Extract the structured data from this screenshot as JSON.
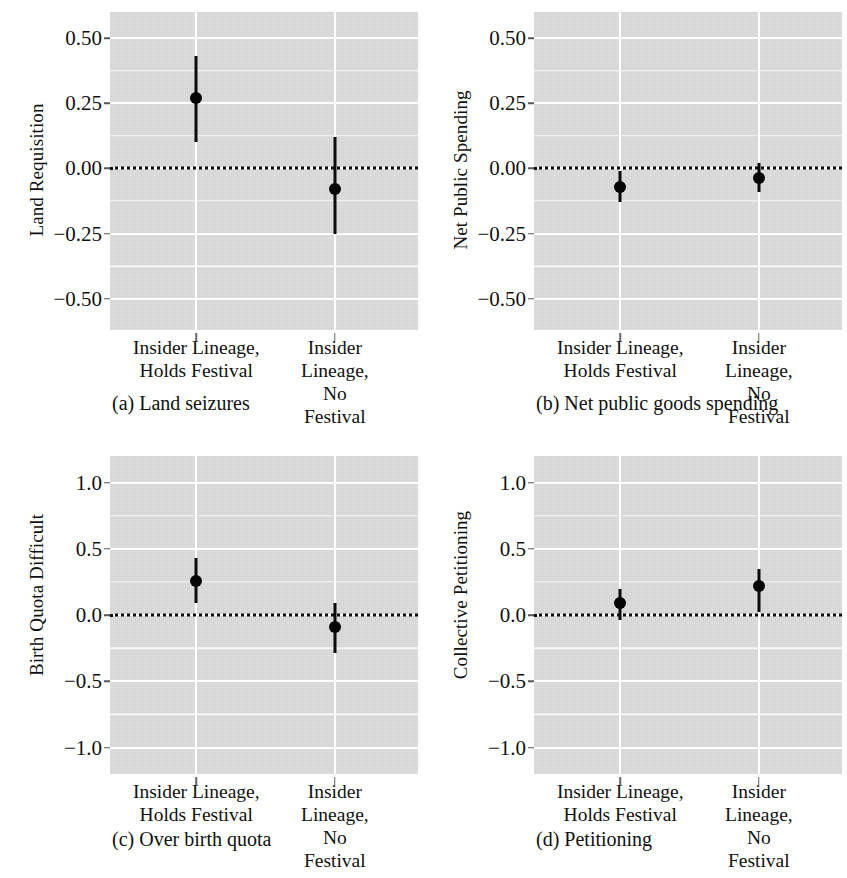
{
  "figure": {
    "panel_count": 4,
    "group_labels": [
      "Insider Lineage,\nHolds Festival",
      "Insider Lineage,\nNo Festival"
    ]
  },
  "panels": {
    "a": {
      "caption": "(a) Land seizures",
      "ylabel": "Land Requisition",
      "yticks": [
        "0.50",
        "0.25",
        "0.00",
        "-0.25",
        "-0.50"
      ],
      "xlabels": [
        "Insider Lineage,\nHolds Festival",
        "Insider Lineage,\nNo Festival"
      ]
    },
    "b": {
      "caption": "(b) Net public goods spending",
      "ylabel": "Net Public Spending",
      "yticks": [
        "0.50",
        "0.25",
        "0.00",
        "-0.25",
        "-0.50"
      ],
      "xlabels": [
        "Insider Lineage,\nHolds Festival",
        "Insider Lineage,\nNo Festival"
      ]
    },
    "c": {
      "caption": "(c) Over birth quota",
      "ylabel": "Birth Quota Difficult",
      "yticks": [
        "1.0",
        "0.5",
        "0.0",
        "-0.5",
        "-1.0"
      ],
      "xlabels": [
        "Insider Lineage,\nHolds Festival",
        "Insider Lineage,\nNo Festival"
      ]
    },
    "d": {
      "caption": "(d) Petitioning",
      "ylabel": "Collective Petitioning",
      "yticks": [
        "1.0",
        "0.5",
        "0.0",
        "-0.5",
        "-1.0"
      ],
      "xlabels": [
        "Insider Lineage,\nHolds Festival",
        "Insider Lineage,\nNo Festival"
      ]
    }
  },
  "chart_data": [
    {
      "panel": "a",
      "type": "scatter",
      "title": "(a) Land seizures",
      "xlabel": "",
      "ylabel": "Land Requisition",
      "categories": [
        "Insider Lineage, Holds Festival",
        "Insider Lineage, No Festival"
      ],
      "values": [
        0.27,
        -0.08
      ],
      "ci_low": [
        0.1,
        -0.25
      ],
      "ci_high": [
        0.43,
        0.12
      ],
      "ylim": [
        -0.62,
        0.6
      ],
      "yticks": [
        0.5,
        0.25,
        0,
        -0.25,
        -0.5
      ],
      "ytick_labels": [
        "0.50",
        "0.25",
        "0.00",
        "-0.25",
        "-0.50"
      ],
      "reference_line": 0,
      "reference_style": "dotted",
      "grid": true,
      "legend": "none"
    },
    {
      "panel": "b",
      "type": "scatter",
      "title": "(b) Net public goods spending",
      "xlabel": "",
      "ylabel": "Net Public Spending",
      "categories": [
        "Insider Lineage, Holds Festival",
        "Insider Lineage, No Festival"
      ],
      "values": [
        -0.07,
        -0.035
      ],
      "ci_low": [
        -0.13,
        -0.09
      ],
      "ci_high": [
        -0.01,
        0.02
      ],
      "ylim": [
        -0.62,
        0.6
      ],
      "yticks": [
        0.5,
        0.25,
        0,
        -0.25,
        -0.5
      ],
      "ytick_labels": [
        "0.50",
        "0.25",
        "0.00",
        "-0.25",
        "-0.50"
      ],
      "reference_line": 0,
      "reference_style": "dotted",
      "grid": true,
      "legend": "none"
    },
    {
      "panel": "c",
      "type": "scatter",
      "title": "(c) Over birth quota",
      "xlabel": "",
      "ylabel": "Birth Quota Difficult",
      "categories": [
        "Insider Lineage, Holds Festival",
        "Insider Lineage, No Festival"
      ],
      "values": [
        0.26,
        -0.09
      ],
      "ci_low": [
        0.09,
        -0.29
      ],
      "ci_high": [
        0.43,
        0.09
      ],
      "ylim": [
        -1.2,
        1.2
      ],
      "yticks": [
        1.0,
        0.5,
        0,
        -0.5,
        -1.0
      ],
      "ytick_labels": [
        "1.0",
        "0.5",
        "0.0",
        "-0.5",
        "-1.0"
      ],
      "reference_line": 0,
      "reference_style": "dotted",
      "grid": true,
      "legend": "none"
    },
    {
      "panel": "d",
      "type": "scatter",
      "title": "(d) Petitioning",
      "xlabel": "",
      "ylabel": "Collective Petitioning",
      "categories": [
        "Insider Lineage, Holds Festival",
        "Insider Lineage, No Festival"
      ],
      "values": [
        0.09,
        0.22
      ],
      "ci_low": [
        -0.04,
        0.02
      ],
      "ci_high": [
        0.2,
        0.35
      ],
      "ylim": [
        -1.2,
        1.2
      ],
      "yticks": [
        1.0,
        0.5,
        0,
        -0.5,
        -1.0
      ],
      "ytick_labels": [
        "1.0",
        "0.5",
        "0.0",
        "-0.5",
        "-1.0"
      ],
      "reference_line": 0,
      "reference_style": "dotted",
      "grid": true,
      "legend": "none"
    }
  ]
}
